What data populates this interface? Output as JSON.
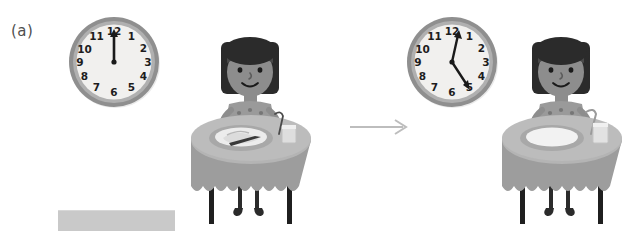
{
  "figure": {
    "part_label": "(a)",
    "background_color": "#ffffff",
    "description_type": "before-after-sequence"
  },
  "panels": [
    {
      "id": "before",
      "clock": {
        "name": "analog-clock",
        "time_label": "12:00",
        "hour_hand_points_to": 12,
        "minute_hand_points_to": 12,
        "numerals": [
          "12",
          "1",
          "2",
          "3",
          "4",
          "5",
          "6",
          "7",
          "8",
          "9",
          "10",
          "11"
        ],
        "face_color": "#f0efed",
        "bezel_color": "#9b9b9b",
        "hand_color": "#1a1a1a"
      },
      "scene": {
        "name": "girl-at-table-with-food",
        "plate_state": "full",
        "items": [
          "plate",
          "food",
          "knife",
          "glass",
          "straw"
        ],
        "table_color": "#a0a0a0",
        "tabletop_color": "#b5b5b5",
        "hair_color": "#2b2b2b",
        "skin_color": "#8a8a8a"
      }
    },
    {
      "id": "after",
      "clock": {
        "name": "analog-clock",
        "time_label": "5:00",
        "hour_hand_points_to": 5,
        "minute_hand_points_to": 12,
        "numerals": [
          "12",
          "1",
          "2",
          "3",
          "4",
          "5",
          "6",
          "7",
          "8",
          "9",
          "10",
          "11"
        ],
        "face_color": "#f0efed",
        "bezel_color": "#9b9b9b",
        "hand_color": "#1a1a1a"
      },
      "scene": {
        "name": "girl-at-table-empty-plate",
        "plate_state": "empty",
        "items": [
          "plate",
          "glass",
          "straw"
        ],
        "table_color": "#a0a0a0",
        "tabletop_color": "#b5b5b5",
        "hair_color": "#2b2b2b",
        "skin_color": "#8a8a8a"
      }
    }
  ],
  "arrow": {
    "name": "transition-arrow",
    "direction": "right",
    "color": "#bdbdbd"
  },
  "redaction": {
    "name": "redaction-bar",
    "color": "#c9c9c9"
  }
}
